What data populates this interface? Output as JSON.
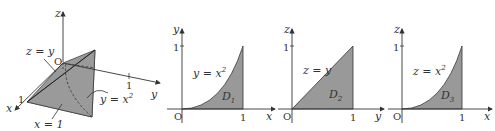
{
  "colors": {
    "fill": "#999999",
    "stroke": "#333333",
    "background": "#ffffff"
  },
  "panel3d": {
    "axis_z": "z",
    "axis_y": "y",
    "axis_x": "x",
    "origin": "O",
    "tick_y": "1",
    "tick_x": "1",
    "label_plane_zy": "z = y",
    "label_surface": "y = x",
    "label_surface_exp": "2",
    "label_plane_x1": "x = 1"
  },
  "panel_d1": {
    "axis_h": "x",
    "axis_v": "y",
    "origin": "O",
    "tick_h": "1",
    "tick_v": "1",
    "curve_label": "y = x",
    "curve_exp": "2",
    "region": "D",
    "region_sub": "1"
  },
  "panel_d2": {
    "axis_h": "y",
    "axis_v": "z",
    "origin": "O",
    "tick_h": "1",
    "tick_v": "1",
    "curve_label": "z = y",
    "region": "D",
    "region_sub": "2"
  },
  "panel_d3": {
    "axis_h": "x",
    "axis_v": "z",
    "origin": "O",
    "tick_h": "1",
    "tick_v": "1",
    "curve_label": "z = x",
    "curve_exp": "2",
    "region": "D",
    "region_sub": "3"
  }
}
